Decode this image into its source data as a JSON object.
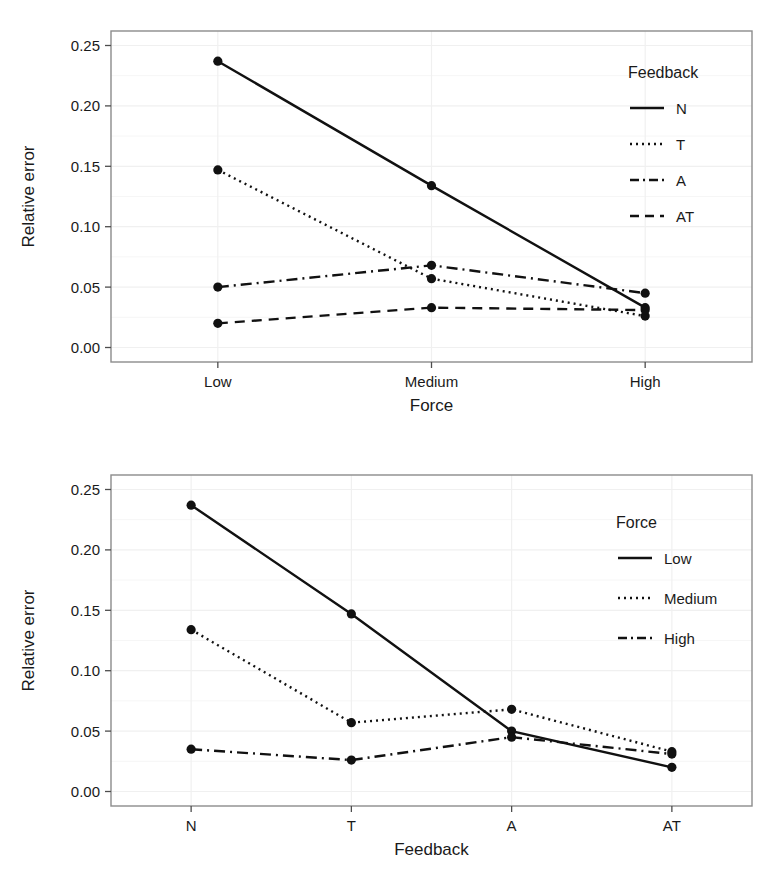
{
  "figure": {
    "background": "#ffffff",
    "line_color": "#111111",
    "point_color": "#111111",
    "panel_border_color": "#8c8c8c",
    "grid_color": "#f0f0f0"
  },
  "chart_data": [
    {
      "id": "top",
      "type": "line",
      "title": "",
      "xlabel": "Force",
      "ylabel": "Relative error",
      "categories": [
        "Low",
        "Medium",
        "High"
      ],
      "yticks": [
        "0.00",
        "0.05",
        "0.10",
        "0.15",
        "0.20",
        "0.25"
      ],
      "ytick_values": [
        0.0,
        0.05,
        0.1,
        0.15,
        0.2,
        0.25
      ],
      "ylim": [
        -0.012,
        0.262
      ],
      "grid": true,
      "legend_title": "Feedback",
      "legend_position": "inside-top-right",
      "series": [
        {
          "name": "N",
          "dash": "solid",
          "values": [
            0.237,
            0.134,
            0.033
          ]
        },
        {
          "name": "T",
          "dash": "dotted",
          "values": [
            0.147,
            0.057,
            0.026
          ]
        },
        {
          "name": "A",
          "dash": "dashdot",
          "values": [
            0.05,
            0.068,
            0.045
          ]
        },
        {
          "name": "AT",
          "dash": "dashed",
          "values": [
            0.02,
            0.033,
            0.031
          ]
        }
      ]
    },
    {
      "id": "bottom",
      "type": "line",
      "title": "",
      "xlabel": "Feedback",
      "ylabel": "Relative error",
      "categories": [
        "N",
        "T",
        "A",
        "AT"
      ],
      "yticks": [
        "0.00",
        "0.05",
        "0.10",
        "0.15",
        "0.20",
        "0.25"
      ],
      "ytick_values": [
        0.0,
        0.05,
        0.1,
        0.15,
        0.2,
        0.25
      ],
      "ylim": [
        -0.012,
        0.262
      ],
      "grid": true,
      "legend_title": "Force",
      "legend_position": "inside-top-right",
      "series": [
        {
          "name": "Low",
          "dash": "solid",
          "values": [
            0.237,
            0.147,
            0.05,
            0.02
          ]
        },
        {
          "name": "Medium",
          "dash": "dotted",
          "values": [
            0.134,
            0.057,
            0.068,
            0.033
          ]
        },
        {
          "name": "High",
          "dash": "dashdot",
          "values": [
            0.035,
            0.026,
            0.045,
            0.031
          ]
        }
      ]
    }
  ]
}
